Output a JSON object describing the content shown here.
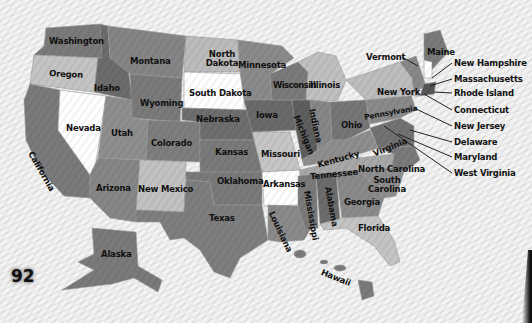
{
  "page_number": "92",
  "colors": {
    "dark": "#6e6e6e",
    "mid": "#8a8a8a",
    "light": "#bdbdbd",
    "white": "#ffffff",
    "background": "#efefef",
    "text": "#111111"
  },
  "states": [
    {
      "id": "washington",
      "label": "Washington"
    },
    {
      "id": "oregon",
      "label": "Oregon"
    },
    {
      "id": "california",
      "label": "California"
    },
    {
      "id": "idaho",
      "label": "Idaho"
    },
    {
      "id": "nevada",
      "label": "Nevada"
    },
    {
      "id": "montana",
      "label": "Montana"
    },
    {
      "id": "wyoming",
      "label": "Wyoming"
    },
    {
      "id": "utah",
      "label": "Utah"
    },
    {
      "id": "arizona",
      "label": "Arizona"
    },
    {
      "id": "colorado",
      "label": "Colorado"
    },
    {
      "id": "new-mexico",
      "label": "New Mexico"
    },
    {
      "id": "north-dakota",
      "label": "North Dakota"
    },
    {
      "id": "south-dakota",
      "label": "South Dakota"
    },
    {
      "id": "nebraska",
      "label": "Nebraska"
    },
    {
      "id": "kansas",
      "label": "Kansas"
    },
    {
      "id": "oklahoma",
      "label": "Oklahoma"
    },
    {
      "id": "texas",
      "label": "Texas"
    },
    {
      "id": "minnesota",
      "label": "Minnesota"
    },
    {
      "id": "iowa",
      "label": "Iowa"
    },
    {
      "id": "missouri",
      "label": "Missouri"
    },
    {
      "id": "arkansas",
      "label": "Arkansas"
    },
    {
      "id": "louisiana",
      "label": "Louisiana"
    },
    {
      "id": "wisconsin",
      "label": "Wisconsin"
    },
    {
      "id": "illinois",
      "label": "Illinois"
    },
    {
      "id": "michigan",
      "label": "Michigan"
    },
    {
      "id": "indiana",
      "label": "Indiana"
    },
    {
      "id": "ohio",
      "label": "Ohio"
    },
    {
      "id": "kentucky",
      "label": "Kentucky"
    },
    {
      "id": "tennessee",
      "label": "Tennessee"
    },
    {
      "id": "mississippi",
      "label": "Mississippi"
    },
    {
      "id": "alabama",
      "label": "Alabama"
    },
    {
      "id": "georgia",
      "label": "Georgia"
    },
    {
      "id": "florida",
      "label": "Florida"
    },
    {
      "id": "south-carolina",
      "label": "South Carolina"
    },
    {
      "id": "north-carolina",
      "label": "North Carolina"
    },
    {
      "id": "virginia",
      "label": "Virginia"
    },
    {
      "id": "pennsylvania",
      "label": "Pennsylvania"
    },
    {
      "id": "new-york",
      "label": "New York"
    },
    {
      "id": "maine",
      "label": "Maine"
    },
    {
      "id": "alaska",
      "label": "Alaska"
    },
    {
      "id": "hawaii",
      "label": "Hawaii"
    }
  ],
  "callouts": [
    {
      "id": "vermont",
      "label": "Vermont"
    },
    {
      "id": "new-hampshire",
      "label": "New Hampshire"
    },
    {
      "id": "massachusetts",
      "label": "Massachusetts"
    },
    {
      "id": "rhode-island",
      "label": "Rhode Island"
    },
    {
      "id": "connecticut",
      "label": "Connecticut"
    },
    {
      "id": "new-jersey",
      "label": "New Jersey"
    },
    {
      "id": "delaware",
      "label": "Delaware"
    },
    {
      "id": "maryland",
      "label": "Maryland"
    },
    {
      "id": "west-virginia",
      "label": "West Virginia"
    }
  ]
}
